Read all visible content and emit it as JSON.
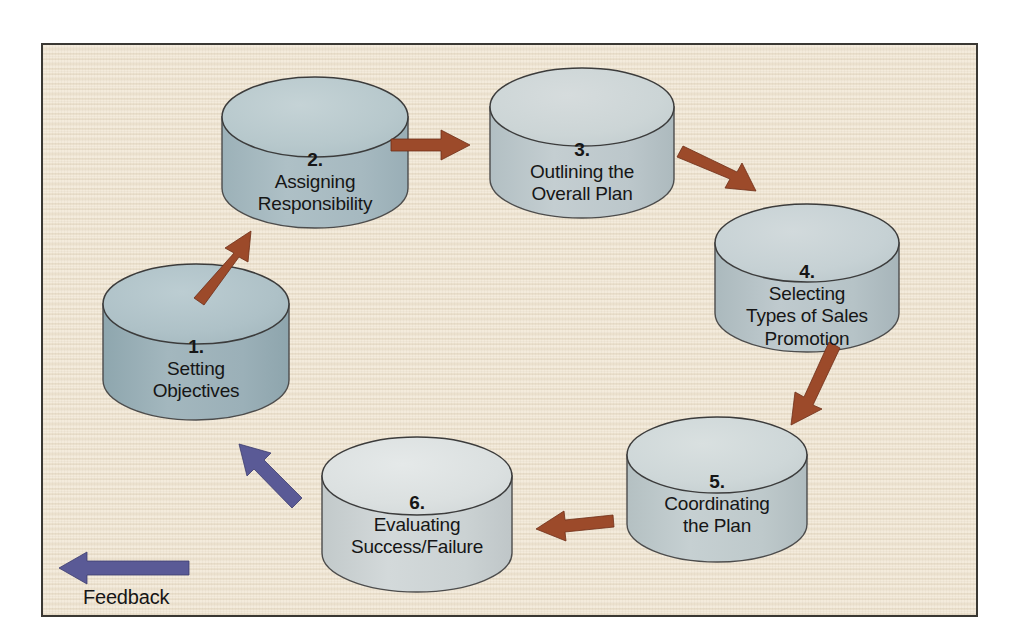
{
  "figure": {
    "type": "cycle-process-diagram",
    "background_color": "#f1e8d8",
    "border_color": "#3a3833",
    "arrow_color_forward": "#9c4a2a",
    "arrow_color_feedback": "#5a5a96"
  },
  "nodes": [
    {
      "id": 1,
      "number": "1.",
      "lines": [
        "Setting",
        "Objectives"
      ],
      "line1": "Setting",
      "line2": "Objectives",
      "line3": "",
      "top_color": "#aec1c7",
      "body_color": "#9cb1b9"
    },
    {
      "id": 2,
      "number": "2.",
      "lines": [
        "Assigning",
        "Responsibility"
      ],
      "line1": "Assigning",
      "line2": "Responsibility",
      "line3": "",
      "top_color": "#b7c8cc",
      "body_color": "#a9bcc2"
    },
    {
      "id": 3,
      "number": "3.",
      "lines": [
        "Outlining the",
        "Overall Plan"
      ],
      "line1": "Outlining the",
      "line2": "Overall Plan",
      "line3": "",
      "top_color": "#ccd5d6",
      "body_color": "#bfcace"
    },
    {
      "id": 4,
      "number": "4.",
      "lines": [
        "Selecting",
        "Types of Sales",
        "Promotion"
      ],
      "line1": "Selecting",
      "line2": "Types of Sales",
      "line3": "Promotion",
      "top_color": "#c6d1d4",
      "body_color": "#b9c6ca"
    },
    {
      "id": 5,
      "number": "5.",
      "lines": [
        "Coordinating",
        "the Plan"
      ],
      "line1": "Coordinating",
      "line2": "the Plan",
      "line3": "",
      "top_color": "#ced7d8",
      "body_color": "#c0cbcd"
    },
    {
      "id": 6,
      "number": "6.",
      "lines": [
        "Evaluating",
        "Success/Failure"
      ],
      "line1": "Evaluating",
      "line2": "Success/Failure",
      "line3": "",
      "top_color": "#dbe0e0",
      "body_color": "#ccd3d4"
    }
  ],
  "arrows": [
    {
      "id": "arrow-1-to-2",
      "from": 1,
      "to": 2,
      "direction": "up-right",
      "color": "#9c4a2a"
    },
    {
      "id": "arrow-2-to-3",
      "from": 2,
      "to": 3,
      "direction": "right",
      "color": "#9c4a2a"
    },
    {
      "id": "arrow-3-to-4",
      "from": 3,
      "to": 4,
      "direction": "down-right",
      "color": "#9c4a2a"
    },
    {
      "id": "arrow-4-to-5",
      "from": 4,
      "to": 5,
      "direction": "down",
      "color": "#9c4a2a"
    },
    {
      "id": "arrow-5-to-6",
      "from": 5,
      "to": 6,
      "direction": "left",
      "color": "#9c4a2a"
    },
    {
      "id": "arrow-6-to-1",
      "from": 6,
      "to": 1,
      "direction": "up-left",
      "color": "#5a5a96"
    }
  ],
  "feedback": {
    "label": "Feedback",
    "arrow_direction": "left",
    "arrow_color": "#5a5a96"
  }
}
